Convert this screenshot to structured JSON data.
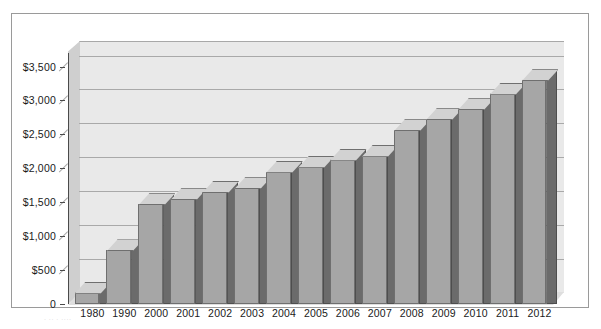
{
  "chart_data": {
    "type": "bar",
    "title": "",
    "subtitle": "",
    "xlabel": "",
    "ylabel": "",
    "categories": [
      "1980",
      "1990",
      "2000",
      "2001",
      "2002",
      "2003",
      "2004",
      "2005",
      "2006",
      "2007",
      "2008",
      "2009",
      "2010",
      "2011",
      "2012"
    ],
    "values": [
      165,
      790,
      1470,
      1545,
      1650,
      1705,
      1950,
      2025,
      2130,
      2185,
      2560,
      2725,
      2870,
      3100,
      3300
    ],
    "series": [
      {
        "name": "",
        "values": [
          165,
          790,
          1470,
          1545,
          1650,
          1705,
          1950,
          2025,
          2130,
          2185,
          2560,
          2725,
          2870,
          3100,
          3300
        ]
      }
    ],
    "ylim": [
      0,
      3700
    ],
    "ytick_values": [
      0,
      500,
      1000,
      1500,
      2000,
      2500,
      3000,
      3500
    ],
    "ytick_labels": [
      "0",
      "$500",
      "$1,000",
      "$1,500",
      "$2,000",
      "$2,500",
      "$3,000",
      "$3,500"
    ],
    "grid": true,
    "grid_axis": "y",
    "legend": false,
    "legend_position": "none",
    "three_d": true,
    "annotations": []
  },
  "colors": {
    "bar_front": "#a6a6a6",
    "bar_side": "#6b6b6b",
    "bar_top": "#d2d2d2",
    "bar_outline": "#6f6f6f",
    "plot_back_wall": "#e9e9e9",
    "plot_left_wall": "#cfcfcf",
    "plot_floor": "#dedede",
    "gridline": "#a9a9a9",
    "axis": "#4a4a4a",
    "frame_border": "#9a9a9a",
    "background": "#ffffff",
    "text": "#1a1a1a"
  },
  "artifact": {
    "caption_fragment": "· ·· · ····"
  }
}
